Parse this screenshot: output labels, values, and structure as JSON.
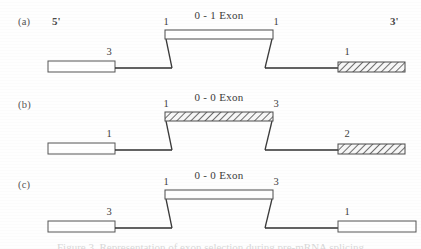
{
  "figure": {
    "width": 421,
    "height": 249,
    "background_color": "#fefefe",
    "line_color": "#3a3a3a",
    "box_fill_open": "#ffffff",
    "box_fill_hatched": "#f2f2f2",
    "caption_sliver_text": "Figure 3. Representation of exon selection during pre-mRNA splicing"
  },
  "panels": [
    {
      "id": "a",
      "panel_label": "(a)",
      "left_end_label": "5'",
      "right_end_label": "3'",
      "exon_title": "0 - 1 Exon",
      "exon_left_number": "1",
      "exon_right_number": "1",
      "exon_fill": "open",
      "left_box_number": "3",
      "left_box_fill": "open",
      "right_box_number": "1",
      "right_box_fill": "hatched"
    },
    {
      "id": "b",
      "panel_label": "(b)",
      "left_end_label": "",
      "right_end_label": "",
      "exon_title": "0 - 0 Exon",
      "exon_left_number": "1",
      "exon_right_number": "3",
      "exon_fill": "hatched",
      "left_box_number": "1",
      "left_box_fill": "open",
      "right_box_number": "2",
      "right_box_fill": "hatched"
    },
    {
      "id": "c",
      "panel_label": "(c)",
      "left_end_label": "",
      "right_end_label": "",
      "exon_title": "0 - 0 Exon",
      "exon_left_number": "1",
      "exon_right_number": "3",
      "exon_fill": "open",
      "left_box_number": "3",
      "left_box_fill": "open",
      "right_box_number": "1",
      "right_box_fill": "open"
    }
  ]
}
